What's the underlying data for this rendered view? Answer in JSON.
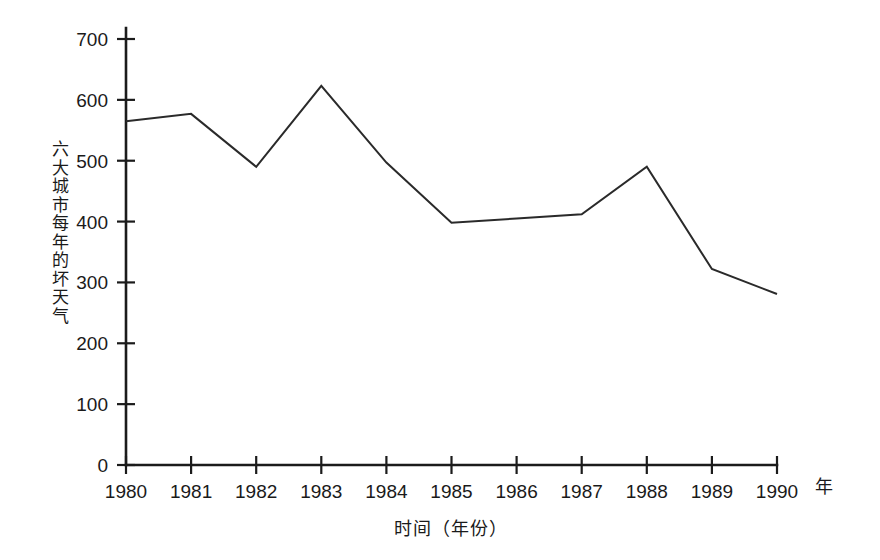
{
  "chart_data": {
    "type": "line",
    "title": "",
    "xlabel": "时间（年份）",
    "ylabel": "六大城市每年的坏天气",
    "x_unit": "年",
    "categories": [
      "1980",
      "1981",
      "1982",
      "1983",
      "1984",
      "1985",
      "1986",
      "1987",
      "1988",
      "1989",
      "1990"
    ],
    "values": [
      565,
      577,
      490,
      623,
      497,
      398,
      405,
      412,
      490,
      322,
      281
    ],
    "series": [
      {
        "name": "六大城市每年的坏天气",
        "values": [
          565,
          577,
          490,
          623,
          497,
          398,
          405,
          412,
          490,
          322,
          281
        ]
      }
    ],
    "ylim": [
      0,
      700
    ],
    "ytick_labels": [
      "0",
      "100",
      "200",
      "300",
      "400",
      "500",
      "600",
      "700"
    ],
    "ytick_values": [
      0,
      100,
      200,
      300,
      400,
      500,
      600,
      700
    ],
    "xtick_labels": [
      "1980",
      "1981",
      "1982",
      "1983",
      "1984",
      "1985",
      "1986",
      "1987",
      "1988",
      "1989",
      "1990"
    ],
    "grid": false,
    "legend": false,
    "legend_position": "none",
    "line_color": "#2a2a2a",
    "axis_color": "#1b1b1b",
    "background_color": "#ffffff"
  }
}
